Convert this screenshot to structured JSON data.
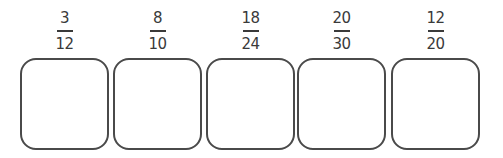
{
  "fractions": [
    {
      "numerator": "3",
      "denominator": "12",
      "answer": ""
    },
    {
      "numerator": "8",
      "denominator": "10",
      "answer": ""
    },
    {
      "numerator": "18",
      "denominator": "24",
      "answer": ""
    },
    {
      "numerator": "20",
      "denominator": "30",
      "answer": ""
    },
    {
      "numerator": "12",
      "denominator": "20",
      "answer": ""
    }
  ]
}
